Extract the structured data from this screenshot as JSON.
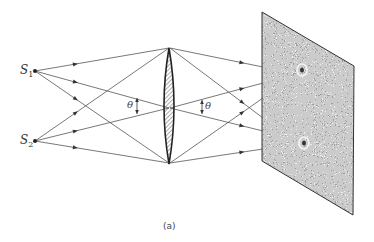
{
  "figure": {
    "caption": "(a)",
    "sources": [
      {
        "id": "S1",
        "label": "S",
        "subscript": "1",
        "x": 35,
        "y": 71
      },
      {
        "id": "S2",
        "label": "S",
        "subscript": "2",
        "x": 35,
        "y": 141
      }
    ],
    "lens": {
      "label": "converging lens",
      "cx": 169,
      "top": 48,
      "bottom": 164,
      "half_width": 5,
      "hatch_color": "#444444"
    },
    "angle_labels": [
      {
        "symbol": "θ",
        "x": 128,
        "y": 100,
        "arrow_x": 137,
        "arrow_y1": 98,
        "arrow_y2": 114
      },
      {
        "symbol": "θ",
        "x": 205,
        "y": 101,
        "arrow_x": 202,
        "arrow_y1": 100,
        "arrow_y2": 114
      }
    ],
    "screen": {
      "label": "speckle screen",
      "corners": [
        [
          262,
          12
        ],
        [
          354,
          66
        ],
        [
          353,
          215
        ],
        [
          262,
          161
        ]
      ],
      "image_spots": [
        {
          "label": "image of S1",
          "x": 302,
          "y": 70
        },
        {
          "label": "image of S2",
          "x": 304,
          "y": 143
        }
      ]
    },
    "rays_left": [
      {
        "from": "S1",
        "to": [
          169,
          48
        ]
      },
      {
        "from": "S1",
        "to": [
          169,
          108
        ]
      },
      {
        "from": "S1",
        "to": [
          169,
          163
        ]
      },
      {
        "from": "S2",
        "to": [
          169,
          48
        ]
      },
      {
        "from": "S2",
        "to": [
          169,
          108
        ]
      },
      {
        "from": "S2",
        "to": [
          169,
          163
        ]
      }
    ],
    "rays_right": [
      {
        "from": [
          170,
          48
        ],
        "to": [
          263,
          67
        ]
      },
      {
        "from": [
          170,
          48
        ],
        "to": [
          263,
          118
        ]
      },
      {
        "from": [
          170,
          108
        ],
        "to": [
          263,
          83
        ]
      },
      {
        "from": [
          170,
          108
        ],
        "to": [
          263,
          131
        ]
      },
      {
        "from": [
          170,
          163
        ],
        "to": [
          263,
          98
        ]
      },
      {
        "from": [
          170,
          163
        ],
        "to": [
          263,
          149
        ]
      }
    ],
    "colors": {
      "line": "#555555",
      "ink": "#333333",
      "background": "#ffffff"
    }
  }
}
